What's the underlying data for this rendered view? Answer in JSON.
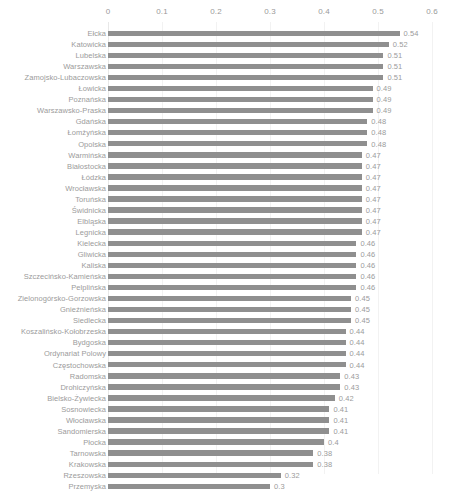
{
  "chart_data": {
    "type": "bar",
    "orientation": "horizontal",
    "title": "",
    "subtitle": "",
    "xlabel": "",
    "ylabel": "",
    "xlim": [
      0,
      0.6
    ],
    "xticks": [
      "0",
      "0.1",
      "0.2",
      "0.3",
      "0.4",
      "0.5",
      "0.6"
    ],
    "xtick_values": [
      0,
      0.1,
      0.2,
      0.3,
      0.4,
      0.5,
      0.6
    ],
    "grid": true,
    "grid_axis": "x",
    "legend": null,
    "axis_position": "top",
    "bar_color": "#8f8f8f",
    "label_color": "#9b9b9b",
    "gridline_color": "#f2f2f2",
    "categories": [
      "Ełcka",
      "Katowicka",
      "Lubelska",
      "Warszawska",
      "Zamojsko-Lubaczowska",
      "Łowicka",
      "Poznańska",
      "Warszawsko-Praska",
      "Gdańska",
      "Łomżyńska",
      "Opolska",
      "Warmińska",
      "Białostocka",
      "Łódzka",
      "Wrocławska",
      "Toruńska",
      "Świdnicka",
      "Elbląska",
      "Legnicka",
      "Kielecka",
      "Gliwicka",
      "Kaliska",
      "Szczecińsko-Kamieńska",
      "Pelplińska",
      "Zielonogórsko-Gorzowska",
      "Gnieźnieńska",
      "Siedlecka",
      "Koszalińsko-Kołobrzeska",
      "Bydgoska",
      "Ordynariat Polowy",
      "Częstochowska",
      "Radomska",
      "Drohiczyńska",
      "Bielsko-Żywiecka",
      "Sosnowiecka",
      "Włocławska",
      "Sandomierska",
      "Płocka",
      "Tarnowska",
      "Krakowska",
      "Rzeszowska",
      "Przemyska"
    ],
    "values": [
      0.54,
      0.52,
      0.51,
      0.51,
      0.51,
      0.49,
      0.49,
      0.49,
      0.48,
      0.48,
      0.48,
      0.47,
      0.47,
      0.47,
      0.47,
      0.47,
      0.47,
      0.47,
      0.47,
      0.46,
      0.46,
      0.46,
      0.46,
      0.46,
      0.45,
      0.45,
      0.45,
      0.44,
      0.44,
      0.44,
      0.44,
      0.43,
      0.43,
      0.42,
      0.41,
      0.41,
      0.41,
      0.4,
      0.38,
      0.38,
      0.32,
      0.3
    ],
    "value_labels": [
      "0.54",
      "0.52",
      "0.51",
      "0.51",
      "0.51",
      "0.49",
      "0.49",
      "0.49",
      "0.48",
      "0.48",
      "0.48",
      "0.47",
      "0.47",
      "0.47",
      "0.47",
      "0.47",
      "0.47",
      "0.47",
      "0.47",
      "0.46",
      "0.46",
      "0.46",
      "0.46",
      "0.46",
      "0.45",
      "0.45",
      "0.45",
      "0.44",
      "0.44",
      "0.44",
      "0.44",
      "0.43",
      "0.43",
      "0.42",
      "0.41",
      "0.41",
      "0.41",
      "0.4",
      "0.38",
      "0.38",
      "0.32",
      "0.3"
    ]
  }
}
